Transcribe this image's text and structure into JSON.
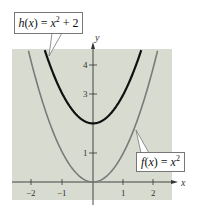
{
  "chart_data": {
    "type": "line",
    "title": "",
    "xlabel": "x",
    "ylabel": "y",
    "xlim": [
      -2.6,
      2.6
    ],
    "ylim": [
      -0.6,
      4.6
    ],
    "x_ticks": [
      -2,
      -1,
      1,
      2
    ],
    "x_tick_labels": [
      "−2",
      "−1",
      "1",
      "2"
    ],
    "y_ticks": [
      1,
      3,
      4
    ],
    "y_tick_labels": [
      "1",
      "3",
      "4"
    ],
    "grid": false,
    "background": "#d8dcd0",
    "series": [
      {
        "name": "h(x) = x^2 + 2",
        "label_text": "h(x) = x² + 2",
        "expression": "x^2 + 2",
        "color": "#111111",
        "x": [
          -1.6,
          -1.2,
          -0.8,
          -0.4,
          0,
          0.4,
          0.8,
          1.2,
          1.6
        ],
        "values": [
          4.56,
          3.44,
          2.64,
          2.16,
          2.0,
          2.16,
          2.64,
          3.44,
          4.56
        ]
      },
      {
        "name": "f(x) = x^2",
        "label_text": "f(x) = x²",
        "expression": "x^2",
        "color": "#7a7a7a",
        "x": [
          -2.1,
          -2,
          -1.5,
          -1,
          -0.5,
          0,
          0.5,
          1,
          1.5,
          2,
          2.1
        ],
        "values": [
          4.41,
          4,
          2.25,
          1,
          0.25,
          0,
          0.25,
          1,
          2.25,
          4,
          4.41
        ]
      }
    ]
  },
  "labels": {
    "h_fn": "h",
    "h_rest_pre": "(",
    "h_var": "x",
    "h_rest_mid": ") = ",
    "h_var2": "x",
    "h_exp": "2",
    "h_tail": " + 2",
    "f_fn": "f",
    "f_rest_pre": "(",
    "f_var": "x",
    "f_rest_mid": ") = ",
    "f_var2": "x",
    "f_exp": "2"
  },
  "axes": {
    "x_name": "x",
    "y_name": "y",
    "x_tick_labels": [
      "−2",
      "−1",
      "1",
      "2"
    ],
    "y_tick_labels": [
      "4",
      "3",
      "1"
    ]
  }
}
